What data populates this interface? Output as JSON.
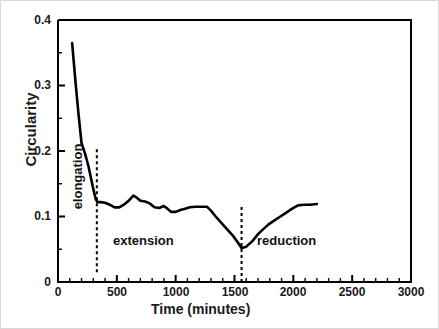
{
  "chart_data": {
    "type": "line",
    "title": "",
    "xlabel": "Time (minutes)",
    "ylabel": "Circularity",
    "xlim": [
      0,
      3000
    ],
    "ylim": [
      0,
      0.4
    ],
    "grid": false,
    "legend": "none",
    "x_major_ticks": [
      0,
      500,
      1000,
      1500,
      2000,
      2500,
      3000
    ],
    "x_tick_labels": [
      "0",
      "500",
      "1000",
      "1500",
      "2000",
      "2500",
      "3000"
    ],
    "x_minor_tick_step": 100,
    "y_major_ticks": [
      0,
      0.1,
      0.2,
      0.3,
      0.4
    ],
    "y_tick_labels": [
      "0",
      "0.1",
      "0.2",
      "0.3",
      "0.4"
    ],
    "y_minor_tick_step": 0.05,
    "series": [
      {
        "name": "Circularity",
        "color": "#000000",
        "x": [
          120,
          150,
          175,
          200,
          230,
          260,
          295,
          320,
          335,
          360,
          400,
          440,
          480,
          520,
          560,
          600,
          640,
          660,
          700,
          740,
          780,
          820,
          860,
          900,
          930,
          960,
          1000,
          1040,
          1080,
          1120,
          1170,
          1220,
          1265,
          1300,
          1340,
          1390,
          1440,
          1490,
          1530,
          1560,
          1600,
          1650,
          1700,
          1740,
          1790,
          1840,
          1890,
          1940,
          1990,
          2040,
          2090,
          2140,
          2200
        ],
        "y": [
          0.365,
          0.303,
          0.255,
          0.212,
          0.196,
          0.176,
          0.146,
          0.127,
          0.122,
          0.122,
          0.121,
          0.118,
          0.114,
          0.114,
          0.118,
          0.124,
          0.132,
          0.13,
          0.124,
          0.123,
          0.12,
          0.114,
          0.113,
          0.116,
          0.112,
          0.107,
          0.107,
          0.11,
          0.112,
          0.114,
          0.115,
          0.115,
          0.115,
          0.109,
          0.1,
          0.09,
          0.08,
          0.07,
          0.06,
          0.052,
          0.054,
          0.062,
          0.073,
          0.08,
          0.088,
          0.094,
          0.1,
          0.106,
          0.112,
          0.117,
          0.118,
          0.118,
          0.119
        ]
      }
    ],
    "annotations": [
      {
        "name": "elongation",
        "label": "elongation",
        "x_range": [
          0,
          330
        ],
        "orientation": "vertical"
      },
      {
        "name": "extension",
        "label": "extension",
        "x_range": [
          330,
          1560
        ],
        "orientation": "horizontal"
      },
      {
        "name": "reduction",
        "label": "reduction",
        "x_range": [
          1560,
          3000
        ],
        "orientation": "horizontal"
      }
    ],
    "divider_lines": [
      {
        "name": "elongation-extension-divider",
        "x": 330,
        "style": "dashed",
        "y_range": [
          0.015,
          0.205
        ]
      },
      {
        "name": "extension-reduction-divider",
        "x": 1560,
        "style": "dashed",
        "y_range": [
          0.0,
          0.115
        ]
      }
    ],
    "colors": {
      "line": "#000000",
      "axis": "#000000",
      "text": "#1a1a1a",
      "background": "#ffffff"
    }
  },
  "axes": {
    "y_title": "Circularity",
    "x_title": "Time (minutes)",
    "y_ticks": [
      "0.4",
      "0.3",
      "0.2",
      "0.1",
      "0"
    ],
    "x_ticks": [
      "0",
      "500",
      "1000",
      "1500",
      "2000",
      "2500",
      "3000"
    ]
  },
  "regions": {
    "elongation": "elongation",
    "extension": "extension",
    "reduction": "reduction"
  }
}
